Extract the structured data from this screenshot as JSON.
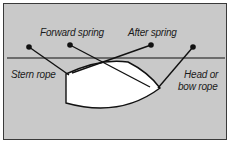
{
  "diagram": {
    "labels": {
      "forward_spring": "Forward spring",
      "after_spring": "After spring",
      "stern_rope": "Stern rope",
      "head_rope_line1": "Head or",
      "head_rope_line2": "bow rope"
    },
    "elements": {
      "quay_edge": "quay-line",
      "bollards": [
        "bollard-stern",
        "bollard-forward-spring",
        "bollard-after-spring",
        "bollard-head"
      ],
      "boat": "boat-hull"
    },
    "colors": {
      "background": "#c9c9c9",
      "line": "#111111",
      "boat_fill": "#ffffff",
      "text": "#1a1a1a"
    }
  }
}
